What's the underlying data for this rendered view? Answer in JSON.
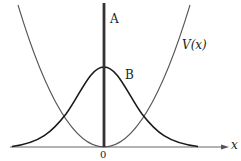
{
  "figure": {
    "type": "diagram",
    "labels": {
      "spike": "A",
      "gaussian": "B",
      "potential": "V(x)",
      "x_axis": "x",
      "origin": "0"
    },
    "colors": {
      "axis": "#555555",
      "potential": "#555555",
      "gaussian": "#1a1a1a",
      "spike": "#333333",
      "background": "#ffffff"
    }
  }
}
